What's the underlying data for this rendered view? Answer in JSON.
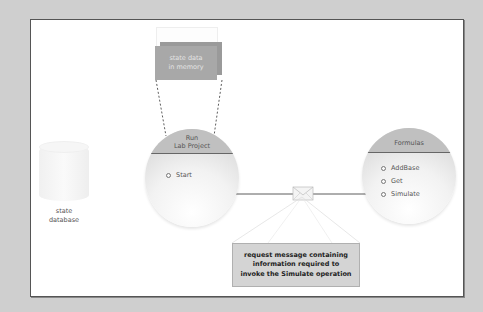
{
  "diagram": {
    "memory_box": {
      "line1": "state data",
      "line2": "in memory"
    },
    "database": {
      "line1": "state",
      "line2": "database"
    },
    "run_service": {
      "title_line1": "Run",
      "title_line2": "Lab Project",
      "operations": [
        {
          "label": "Start"
        }
      ]
    },
    "formulas_service": {
      "title": "Formulas",
      "operations": [
        {
          "label": "AddBase"
        },
        {
          "label": "Get"
        },
        {
          "label": "Simulate"
        }
      ]
    },
    "message": {
      "line1": "request message containing",
      "line2": "information required to",
      "line3": "invoke the Simulate operation"
    }
  },
  "colors": {
    "background": "#cfcfcf",
    "frame": "#ffffff",
    "memory_box": "#a8a8a8",
    "circle_header": "#c0c0c0",
    "message_box": "#d4d4d4"
  }
}
